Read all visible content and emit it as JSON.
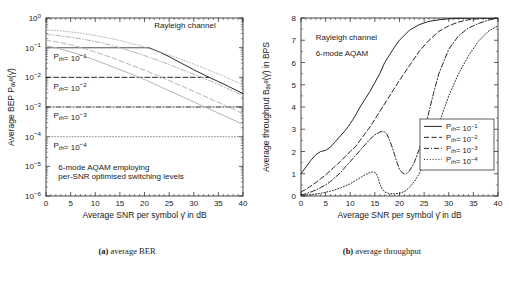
{
  "figure": {
    "panels": [
      {
        "caption_tag": "(a)",
        "caption_text": " average BER"
      },
      {
        "caption_tag": "(b)",
        "caption_text": " average throughput"
      }
    ]
  },
  "chart_data": [
    {
      "type": "line",
      "panel": "a",
      "title": "",
      "xlabel": "Average SNR per symbol γ̄  in dB",
      "ylabel": "Average BEP Pₐᵥᵍ(γ̄)",
      "xlim": [
        0,
        40
      ],
      "ylim": [
        1e-06,
        1
      ],
      "yscale": "log",
      "xticks": [
        0,
        5,
        10,
        15,
        20,
        25,
        30,
        35,
        40
      ],
      "xticklabels": [
        "0",
        "5",
        "10",
        "15",
        "20",
        "25",
        "30",
        "35",
        "40"
      ],
      "yticks": [
        1,
        0.1,
        0.01,
        0.001,
        0.0001,
        1e-05,
        1e-06
      ],
      "yticklabels": [
        "10^0",
        "10^-1",
        "10^-2",
        "10^-3",
        "10^-4",
        "10^-5",
        "10^-6"
      ],
      "grid": false,
      "annotations": [
        {
          "text": "Rayleigh channel",
          "x": 22,
          "y": 0.45
        },
        {
          "text": "P_th= 10^-1",
          "x": 1.5,
          "y": 0.042
        },
        {
          "text": "P_th= 10^-2",
          "x": 1.5,
          "y": 0.0042
        },
        {
          "text": "P_th= 10^-3",
          "x": 1.5,
          "y": 0.00042
        },
        {
          "text": "P_th= 10^-4",
          "x": 1.5,
          "y": 4.2e-05
        },
        {
          "text": "6-mode AQAM employing",
          "x": 2.5,
          "y": 7.5e-06
        },
        {
          "text": "per-SNR optimised switching levels",
          "x": 2.5,
          "y": 3.8e-06
        }
      ],
      "series": [
        {
          "name": "Rayleigh channel",
          "style": "solid",
          "color": "#1a1a1a",
          "x": [
            0,
            5,
            10,
            15,
            20,
            21,
            23,
            25,
            27,
            30,
            33,
            35,
            37,
            40
          ],
          "y": [
            0.1,
            0.1,
            0.1,
            0.1,
            0.1,
            0.098,
            0.072,
            0.05,
            0.033,
            0.018,
            0.0102,
            0.0072,
            0.005,
            0.0028
          ]
        },
        {
          "name": "P_th = 10^-1 target BEP line",
          "style": "solid",
          "color": "#8c8c8c",
          "x": [
            0,
            20
          ],
          "y": [
            0.1,
            0.1
          ]
        },
        {
          "name": "P_th = 10^-2 target BEP line",
          "style": "dashed",
          "color": "#1a1a1a",
          "x": [
            0,
            33
          ],
          "y": [
            0.01,
            0.01
          ]
        },
        {
          "name": "P_th = 10^-3 target BEP line",
          "style": "dashdot",
          "color": "#1a1a1a",
          "x": [
            0,
            40
          ],
          "y": [
            0.001,
            0.001
          ]
        },
        {
          "name": "P_th = 10^-4 target BEP line",
          "style": "dotted",
          "color": "#8c8c8c",
          "x": [
            0,
            40
          ],
          "y": [
            0.0001,
            0.0001
          ]
        },
        {
          "name": "BEP curve P_th=10^-1",
          "style": "solid",
          "color": "#b0b0b0",
          "x": [
            0,
            2,
            5,
            8,
            11,
            14,
            17,
            20,
            24,
            28,
            32,
            36,
            40
          ],
          "y": [
            0.115,
            0.1,
            0.072,
            0.05,
            0.033,
            0.021,
            0.0135,
            0.0085,
            0.0042,
            0.0021,
            0.00105,
            0.00052,
            0.00026
          ]
        },
        {
          "name": "BEP curve P_th=10^-2",
          "style": "dashed",
          "color": "#b0b0b0",
          "x": [
            0,
            2,
            5,
            8,
            11,
            14,
            17,
            20,
            24,
            28,
            32,
            36,
            40
          ],
          "y": [
            0.175,
            0.16,
            0.125,
            0.091,
            0.063,
            0.042,
            0.027,
            0.0175,
            0.0092,
            0.0047,
            0.0024,
            0.0012,
            0.0006
          ]
        },
        {
          "name": "BEP curve P_th=10^-3",
          "style": "dashdot",
          "color": "#b0b0b0",
          "x": [
            0,
            3,
            7,
            11,
            15,
            19,
            23,
            27,
            31,
            35,
            40
          ],
          "y": [
            0.28,
            0.25,
            0.2,
            0.15,
            0.1,
            0.062,
            0.036,
            0.02,
            0.011,
            0.0058,
            0.0024
          ]
        },
        {
          "name": "BEP curve P_th=10^-4",
          "style": "dotted",
          "color": "#b0b0b0",
          "x": [
            0,
            3,
            7,
            11,
            15,
            19,
            23,
            27,
            31,
            35,
            40
          ],
          "y": [
            0.4,
            0.37,
            0.31,
            0.24,
            0.175,
            0.118,
            0.073,
            0.043,
            0.024,
            0.013,
            0.0056
          ]
        }
      ]
    },
    {
      "type": "line",
      "panel": "b",
      "title": "",
      "xlabel": "Average SNR per symbol γ̄  in dB",
      "ylabel": "Average throughput Bₐᵥᵍ(γ̄) in BPS",
      "xlim": [
        0,
        40
      ],
      "ylim": [
        0,
        8
      ],
      "yscale": "linear",
      "xticks": [
        0,
        5,
        10,
        15,
        20,
        25,
        30,
        35,
        40
      ],
      "xticklabels": [
        "0",
        "5",
        "10",
        "15",
        "20",
        "25",
        "30",
        "35",
        "40"
      ],
      "yticks": [
        0,
        1,
        2,
        3,
        4,
        5,
        6,
        7,
        8
      ],
      "yticklabels": [
        "0",
        "1",
        "2",
        "3",
        "4",
        "5",
        "6",
        "7",
        "8"
      ],
      "grid": false,
      "annotations": [
        {
          "text": "Rayleigh channel",
          "x": 3,
          "y": 7.0
        },
        {
          "text": "6-mode AQAM",
          "x": 3,
          "y": 6.3
        }
      ],
      "legend": {
        "position": "lower-right",
        "entries": [
          {
            "label": "P_th= 10^-1",
            "style": "solid"
          },
          {
            "label": "P_th= 10^-2",
            "style": "dashed"
          },
          {
            "label": "P_th= 10^-3",
            "style": "dashdot"
          },
          {
            "label": "P_th= 10^-4",
            "style": "dotted"
          }
        ]
      },
      "series": [
        {
          "name": "P_th = 10^-1",
          "style": "solid",
          "color": "#1a1a1a",
          "x": [
            0,
            1,
            2,
            3,
            4,
            5,
            6,
            7,
            8,
            9,
            10,
            11,
            12,
            13,
            14,
            15,
            16,
            17,
            18,
            19,
            20,
            22,
            24,
            26,
            28,
            30,
            32,
            34,
            36,
            38,
            40
          ],
          "y": [
            1.0,
            1.3,
            1.6,
            1.85,
            2.0,
            2.05,
            2.2,
            2.45,
            2.7,
            2.95,
            3.25,
            3.6,
            4.0,
            4.35,
            4.7,
            5.1,
            5.5,
            6.0,
            6.35,
            6.7,
            7.0,
            7.45,
            7.7,
            7.85,
            7.92,
            7.96,
            7.98,
            7.99,
            8.0,
            8.0,
            8.0
          ]
        },
        {
          "name": "P_th = 10^-2",
          "style": "dashed",
          "color": "#1a1a1a",
          "x": [
            0,
            1,
            2,
            3,
            4,
            5,
            6,
            7,
            8,
            9,
            10,
            11,
            12,
            13,
            14,
            15,
            16,
            18,
            20,
            22,
            24,
            26,
            28,
            30,
            32,
            34,
            36,
            38,
            40
          ],
          "y": [
            0.18,
            0.3,
            0.45,
            0.6,
            0.78,
            0.95,
            1.15,
            1.35,
            1.55,
            1.78,
            2.0,
            2.2,
            2.5,
            2.8,
            3.1,
            3.45,
            3.8,
            4.5,
            5.2,
            5.85,
            6.5,
            7.0,
            7.4,
            7.65,
            7.82,
            7.92,
            7.97,
            7.99,
            8.0
          ]
        },
        {
          "name": "P_th = 10^-3",
          "style": "dashdot",
          "color": "#1a1a1a",
          "x": [
            0,
            1,
            2,
            3,
            4,
            5,
            6,
            7,
            8,
            9,
            10,
            11,
            12,
            13,
            14,
            15,
            16,
            16.5,
            17,
            17.5,
            18,
            18.5,
            19,
            19.5,
            20,
            20.5,
            21,
            21.5,
            22,
            23,
            24,
            25,
            26,
            27,
            28,
            30,
            32,
            34,
            36,
            38,
            40
          ],
          "y": [
            0.05,
            0.1,
            0.18,
            0.27,
            0.38,
            0.5,
            0.65,
            0.85,
            1.05,
            1.3,
            1.55,
            1.8,
            2.05,
            2.3,
            2.55,
            2.75,
            2.87,
            2.9,
            2.88,
            2.75,
            2.5,
            2.2,
            1.85,
            1.5,
            1.2,
            1.05,
            1.0,
            1.02,
            1.12,
            1.5,
            2.1,
            2.9,
            3.8,
            4.7,
            5.5,
            6.6,
            7.2,
            7.55,
            7.75,
            7.9,
            8.0
          ]
        },
        {
          "name": "P_th = 10^-4",
          "style": "dotted",
          "color": "#1a1a1a",
          "x": [
            0,
            2,
            4,
            6,
            8,
            10,
            11,
            12,
            13,
            14,
            14.5,
            15,
            15.3,
            15.6,
            16,
            16.5,
            17,
            18,
            19,
            20,
            21,
            22,
            23,
            24,
            25,
            26,
            27,
            28,
            30,
            32,
            34,
            36,
            38,
            40
          ],
          "y": [
            0.02,
            0.06,
            0.12,
            0.22,
            0.36,
            0.55,
            0.68,
            0.82,
            0.95,
            1.05,
            1.08,
            1.06,
            1.0,
            0.85,
            0.55,
            0.3,
            0.18,
            0.1,
            0.1,
            0.12,
            0.2,
            0.38,
            0.65,
            1.0,
            1.45,
            2.0,
            2.6,
            3.25,
            4.5,
            5.5,
            6.3,
            6.95,
            7.4,
            7.65
          ]
        }
      ]
    }
  ]
}
